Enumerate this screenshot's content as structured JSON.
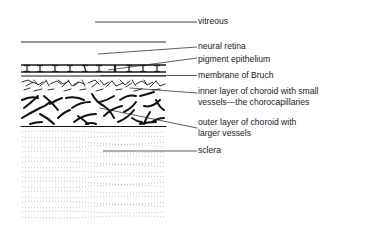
{
  "diagram": {
    "type": "anatomical cross-section",
    "colors": {
      "ink": "#1a1a1a",
      "background": "#ffffff",
      "stipple": "#9a9a9a"
    },
    "labels": [
      {
        "id": "vitreous",
        "line1": "vitreous",
        "line2": ""
      },
      {
        "id": "neural-retina",
        "line1": "neural retina",
        "line2": ""
      },
      {
        "id": "pigment-epithelium",
        "line1": "pigment epithelium",
        "line2": ""
      },
      {
        "id": "membrane-of-bruch",
        "line1": "membrane of Bruch",
        "line2": ""
      },
      {
        "id": "inner-choroid",
        "line1": "inner layer of choroid with small",
        "line2": "vessels—the chorocapillaries"
      },
      {
        "id": "outer-choroid",
        "line1": "outer layer of choroid with",
        "line2": "larger vessels"
      },
      {
        "id": "sclera",
        "line1": "sclera",
        "line2": ""
      }
    ]
  }
}
